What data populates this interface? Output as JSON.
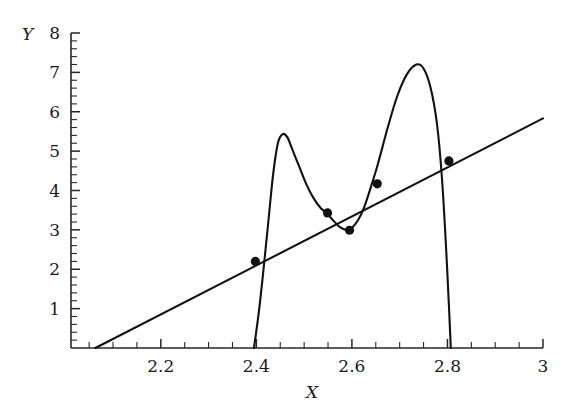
{
  "chart_data": {
    "type": "line",
    "title": "",
    "xlabel": "X",
    "ylabel": "Y",
    "xlim": [
      2.012,
      3.0
    ],
    "ylim": [
      0,
      8
    ],
    "grid": false,
    "legend": "none",
    "x_ticks": [
      2.2,
      2.4,
      2.6,
      2.8,
      3
    ],
    "x_tick_labels": [
      "2.2",
      "2.4",
      "2.6",
      "2.8",
      "3"
    ],
    "x_minor_tick_step": 0.05,
    "y_ticks": [
      1,
      2,
      3,
      4,
      5,
      6,
      7,
      8
    ],
    "y_tick_labels": [
      "1",
      "2",
      "3",
      "4",
      "5",
      "6",
      "7",
      "8"
    ],
    "y_minor_tick_step": 0.2,
    "series": [
      {
        "name": "straight-line",
        "type": "line",
        "points": [
          {
            "x": 2.063,
            "y": 0.0
          },
          {
            "x": 3.0,
            "y": 5.83
          }
        ]
      },
      {
        "name": "oscillating-curve",
        "type": "line",
        "points": [
          {
            "x": 2.395,
            "y": 0.0
          },
          {
            "x": 2.405,
            "y": 0.9
          },
          {
            "x": 2.415,
            "y": 2.0
          },
          {
            "x": 2.425,
            "y": 3.2
          },
          {
            "x": 2.435,
            "y": 4.4
          },
          {
            "x": 2.445,
            "y": 5.2
          },
          {
            "x": 2.455,
            "y": 5.43
          },
          {
            "x": 2.465,
            "y": 5.35
          },
          {
            "x": 2.475,
            "y": 5.05
          },
          {
            "x": 2.49,
            "y": 4.6
          },
          {
            "x": 2.505,
            "y": 4.15
          },
          {
            "x": 2.52,
            "y": 3.8
          },
          {
            "x": 2.535,
            "y": 3.55
          },
          {
            "x": 2.548,
            "y": 3.42
          },
          {
            "x": 2.56,
            "y": 3.25
          },
          {
            "x": 2.575,
            "y": 3.07
          },
          {
            "x": 2.588,
            "y": 3.0
          },
          {
            "x": 2.6,
            "y": 3.05
          },
          {
            "x": 2.613,
            "y": 3.25
          },
          {
            "x": 2.625,
            "y": 3.55
          },
          {
            "x": 2.64,
            "y": 4.1
          },
          {
            "x": 2.655,
            "y": 4.7
          },
          {
            "x": 2.675,
            "y": 5.6
          },
          {
            "x": 2.695,
            "y": 6.4
          },
          {
            "x": 2.715,
            "y": 6.95
          },
          {
            "x": 2.735,
            "y": 7.2
          },
          {
            "x": 2.75,
            "y": 7.1
          },
          {
            "x": 2.765,
            "y": 6.6
          },
          {
            "x": 2.778,
            "y": 5.7
          },
          {
            "x": 2.788,
            "y": 4.4
          },
          {
            "x": 2.796,
            "y": 2.8
          },
          {
            "x": 2.803,
            "y": 1.1
          },
          {
            "x": 2.807,
            "y": 0.0
          }
        ]
      }
    ],
    "markers": {
      "name": "intersection-points",
      "style": "filled-circle",
      "points": [
        {
          "x": 2.398,
          "y": 2.2
        },
        {
          "x": 2.549,
          "y": 3.43
        },
        {
          "x": 2.595,
          "y": 2.99
        },
        {
          "x": 2.653,
          "y": 4.17
        },
        {
          "x": 2.803,
          "y": 4.75
        }
      ]
    }
  },
  "caption": {
    "partial_text": ""
  }
}
